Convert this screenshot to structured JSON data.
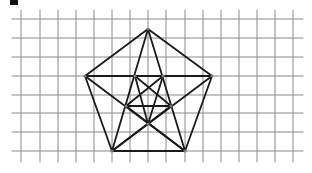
{
  "figure": {
    "grid": {
      "vertical_lines_x": [
        21,
        40,
        58,
        76,
        94,
        112,
        130,
        148,
        166,
        185,
        203,
        221,
        239,
        257,
        275,
        293
      ],
      "horizontal_lines_y": [
        19,
        38,
        57,
        76,
        95,
        113,
        132,
        151
      ],
      "x_start": 12,
      "x_end": 303,
      "y_start": 10,
      "y_end": 162,
      "color": "#8a8a8a"
    },
    "outer_vertices": {
      "top": [
        148,
        29
      ],
      "left": [
        85,
        76
      ],
      "right": [
        212,
        76
      ],
      "bottom_left": [
        112,
        151
      ],
      "bottom_right": [
        185,
        151
      ]
    },
    "inner_vertices": {
      "upper_left": [
        135,
        76
      ],
      "upper_right": [
        163,
        76
      ],
      "mid_left": [
        126,
        106
      ],
      "mid_right": [
        171,
        106
      ],
      "bottom": [
        148,
        124
      ]
    },
    "line_color": "#1a1a1a",
    "vertex_color": "#777777"
  }
}
